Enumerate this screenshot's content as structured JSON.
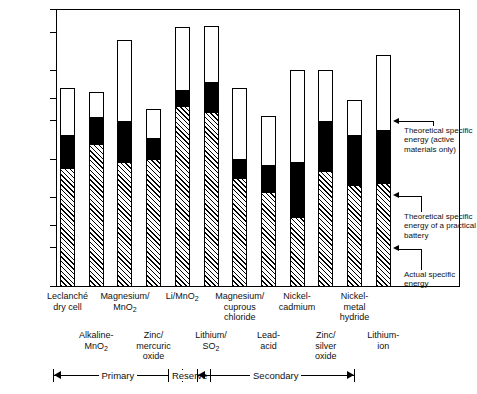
{
  "chart_data": {
    "type": "bar",
    "title": "",
    "xlabel": "",
    "ylabel": "Watthours/kilogram",
    "scale": "log",
    "ylim": [
      10,
      1500
    ],
    "yticks": [
      10,
      20,
      30,
      50,
      100,
      200,
      300,
      500,
      1000,
      1500
    ],
    "ytick_labels": [
      "10",
      "20",
      "30",
      "50",
      "100",
      "200",
      "300",
      "500",
      "1000",
      "1500"
    ],
    "grid": false,
    "stacked": true,
    "legend_position": "right",
    "series": [
      {
        "name": "Actual specific energy",
        "fill": "hatched",
        "values": [
          85,
          130,
          95,
          100,
          260,
          235,
          70,
          55,
          35,
          80,
          62,
          65
        ]
      },
      {
        "name": "Theoretical specific energy of a practical battery",
        "fill": "solid-black",
        "values": [
          155,
          215,
          200,
          145,
          345,
          400,
          100,
          90,
          95,
          200,
          155,
          170
        ]
      },
      {
        "name": "Theoretical specific energy (active materials only)",
        "fill": "white",
        "values": [
          360,
          340,
          860,
          250,
          1100,
          1120,
          360,
          220,
          500,
          500,
          290,
          660
        ]
      }
    ],
    "categories": [
      "Leclanché dry cell",
      "Alkaline-MnO2",
      "Magnesium/MnO2",
      "Zinc/mercuric oxide",
      "Li/MnO2",
      "Lithium/SO2",
      "Magnesium/cuprous chloride",
      "Lead-acid",
      "Nickel-cadmium",
      "Zinc/silver oxide",
      "Nickel-metal hydride",
      "Lithium-ion"
    ]
  },
  "axis": {
    "y_label": "Watthours/kilogram",
    "ticks": [
      {
        "value": 1500,
        "label": "1500"
      },
      {
        "value": 1000,
        "label": "1000"
      },
      {
        "value": 500,
        "label": "500"
      },
      {
        "value": 300,
        "label": "300"
      },
      {
        "value": 200,
        "label": "200"
      },
      {
        "value": 100,
        "label": "100"
      },
      {
        "value": 50,
        "label": "50"
      },
      {
        "value": 30,
        "label": "30"
      },
      {
        "value": 20,
        "label": "20"
      },
      {
        "value": 10,
        "label": "10"
      }
    ]
  },
  "bars": [
    {
      "id": "leclanche-dry-cell",
      "row": "A",
      "label_lines": [
        "Leclanché",
        "dry cell"
      ],
      "actual": 85,
      "practical": 155,
      "theoretical": 360
    },
    {
      "id": "alkaline-mno2",
      "row": "B",
      "label_lines": [
        "Alkaline-",
        "MnO₂"
      ],
      "actual": 130,
      "practical": 215,
      "theoretical": 340
    },
    {
      "id": "magnesium-mno2",
      "row": "A",
      "label_lines": [
        "Magnesium/",
        "MnO₂"
      ],
      "actual": 95,
      "practical": 200,
      "theoretical": 860
    },
    {
      "id": "zinc-mercuric-oxide",
      "row": "B",
      "label_lines": [
        "Zinc/",
        "mercuric",
        "oxide"
      ],
      "actual": 100,
      "practical": 145,
      "theoretical": 250
    },
    {
      "id": "li-mno2",
      "row": "A",
      "label_lines": [
        "Li/MnO₂"
      ],
      "actual": 260,
      "practical": 345,
      "theoretical": 1100
    },
    {
      "id": "lithium-so2",
      "row": "B",
      "label_lines": [
        "Lithium/",
        "SO₂"
      ],
      "actual": 235,
      "practical": 400,
      "theoretical": 1120
    },
    {
      "id": "magnesium-cuprous-chloride",
      "row": "A",
      "label_lines": [
        "Magnesium/",
        "cuprous",
        "chloride"
      ],
      "actual": 70,
      "practical": 100,
      "theoretical": 360
    },
    {
      "id": "lead-acid",
      "row": "B",
      "label_lines": [
        "Lead-",
        "acid"
      ],
      "actual": 55,
      "practical": 90,
      "theoretical": 220
    },
    {
      "id": "nickel-cadmium",
      "row": "A",
      "label_lines": [
        "Nickel-",
        "cadmium"
      ],
      "actual": 35,
      "practical": 95,
      "theoretical": 500
    },
    {
      "id": "zinc-silver-oxide",
      "row": "B",
      "label_lines": [
        "Zinc/",
        "silver",
        "oxide"
      ],
      "actual": 80,
      "practical": 200,
      "theoretical": 500
    },
    {
      "id": "nickel-metal-hydride",
      "row": "A",
      "label_lines": [
        "Nickel-",
        "metal",
        "hydride"
      ],
      "actual": 62,
      "practical": 155,
      "theoretical": 290
    },
    {
      "id": "lithium-ion",
      "row": "B",
      "label_lines": [
        "Lithium-",
        "ion"
      ],
      "actual": 65,
      "practical": 170,
      "theoretical": 660
    }
  ],
  "groups": [
    {
      "id": "primary",
      "label": "Primary",
      "start_bar": 0,
      "end_bar": 3,
      "arrows": "both"
    },
    {
      "id": "reserve",
      "label": "Reserve",
      "start_bar": 4,
      "end_bar": 4,
      "arrows": "none"
    },
    {
      "id": "secondary",
      "label": "Secondary",
      "start_bar": 5,
      "end_bar": 9,
      "arrows": "both"
    }
  ],
  "legend": {
    "items": [
      {
        "id": "theoretical-active-materials",
        "fill": "white",
        "text": "Theoretical specific energy (active materials only)"
      },
      {
        "id": "theoretical-practical-battery",
        "fill": "black",
        "text": "Theoretical specific energy of a practical battery"
      },
      {
        "id": "actual-specific-energy",
        "fill": "hatched",
        "text": "Actual specific energy"
      }
    ],
    "key_bar": {
      "actual": 65,
      "practical": 170,
      "theoretical": 660
    }
  },
  "colors": {
    "axis": "#000000",
    "bar_outline": "#000000",
    "practical_fill": "#000000",
    "theoretical_fill": "#ffffff",
    "actual_fill": "hatched",
    "background": "#ffffff"
  }
}
